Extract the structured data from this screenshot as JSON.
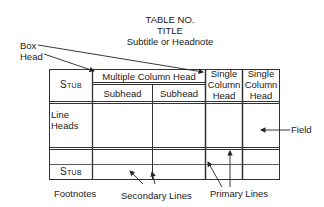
{
  "header": {
    "table_no": "TABLE NO.",
    "title": "TITLE",
    "subtitle": "Subtitle or Headnote"
  },
  "table": {
    "stub_head": "Stub",
    "multiple_column_head": "Multiple Column Head",
    "subheads": [
      "Subhead",
      "Subhead"
    ],
    "single_column_heads": [
      [
        "Single",
        "Column",
        "Head"
      ],
      [
        "Single",
        "Column",
        "Head"
      ]
    ],
    "line_heads": [
      "Line",
      "Heads"
    ],
    "stub_footer": "Stub"
  },
  "annotations": {
    "box_head": [
      "Box",
      "Head"
    ],
    "field": "Field",
    "footnotes": "Footnotes",
    "secondary_lines": "Secondary Lines",
    "primary_lines": "Primary Lines"
  },
  "colors": {
    "line": "#333333",
    "text": "#222222",
    "background": "#ffffff"
  }
}
